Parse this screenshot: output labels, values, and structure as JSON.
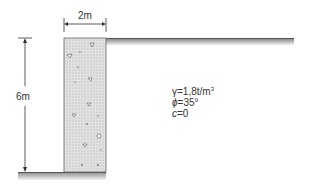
{
  "diagram": {
    "wall_width_label": "2m",
    "wall_height_label": "6m",
    "soil_parameters": {
      "gamma_symbol": "γ",
      "gamma_value": "=1,8t/m",
      "gamma_unit_exp": "3",
      "phi_symbol": "ϕ",
      "phi_value": "=35°",
      "c_symbol": "c",
      "c_value": "=0"
    }
  }
}
